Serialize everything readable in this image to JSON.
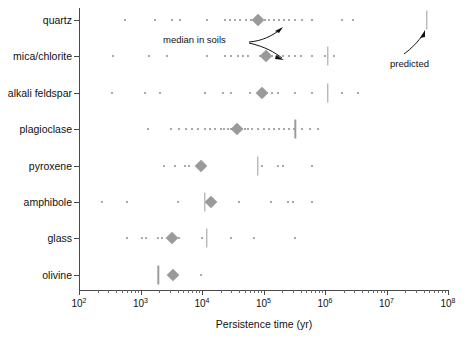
{
  "chart_data": {
    "type": "scatter",
    "title": "",
    "xlabel": "Persistence time (yr)",
    "ylabel": "",
    "xscale": "log",
    "xlim": [
      100,
      100000000
    ],
    "grid": false,
    "legend": "none",
    "xtick_labels": [
      "10",
      "10",
      "10",
      "10",
      "10",
      "10",
      "10"
    ],
    "xtick_exponents": [
      "2",
      "3",
      "4",
      "5",
      "6",
      "7",
      "8"
    ],
    "xtick_values": [
      100,
      1000,
      10000,
      100000,
      1000000,
      10000000,
      100000000
    ],
    "categories": [
      "quartz",
      "mica/chlorite",
      "alkali feldspar",
      "plagioclase",
      "pyroxene",
      "amphibole",
      "glass",
      "olivine"
    ],
    "marker_legend": {
      "dot": "individual soil observation",
      "diamond": "median in soils",
      "bar": "predicted"
    },
    "annotations": [
      {
        "text": "median in soils",
        "x": 100000,
        "y": "between quartz and mica/chlorite"
      },
      {
        "text": "predicted",
        "x": 30000000,
        "y": "below quartz predicted bar"
      }
    ],
    "series": [
      {
        "name": "quartz",
        "median_in_soils": 80000,
        "predicted": 45000000,
        "observations": [
          560,
          1700,
          3200,
          4400,
          12000,
          24000,
          28000,
          34000,
          42000,
          52000,
          62000,
          72000,
          88000,
          105000,
          125000,
          150000,
          180000,
          215000,
          260000,
          320000,
          420000,
          620000,
          1900000,
          2900000
        ]
      },
      {
        "name": "mica/chlorite",
        "median_in_soils": 110000,
        "predicted": 1100000,
        "observations": [
          360,
          1400,
          2700,
          12000,
          24000,
          30000,
          38000,
          46000,
          56000,
          88000,
          140000,
          170000,
          210000,
          260000,
          320000,
          400000,
          620000,
          1000000,
          1400000
        ]
      },
      {
        "name": "alkali feldspar",
        "median_in_soils": 93000,
        "predicted": 1100000,
        "observations": [
          340,
          1200,
          2100,
          11000,
          22000,
          30000,
          60000,
          93000,
          115000,
          140000,
          175000,
          330000,
          620000,
          1900000,
          3400000
        ]
      },
      {
        "name": "plagioclase",
        "median_in_soils": 37000,
        "predicted": 330000,
        "observations": [
          1300,
          3100,
          4200,
          5400,
          6800,
          8600,
          11000,
          13500,
          16000,
          20000,
          23000,
          26000,
          30000,
          34000,
          37000,
          44000,
          50000,
          57000,
          66000,
          80000,
          100000,
          125000,
          150000,
          180000,
          215000,
          260000,
          310000,
          420000,
          560000,
          760000
        ]
      },
      {
        "name": "pyroxene",
        "median_in_soils": 9500,
        "predicted": 80000,
        "observations": [
          2400,
          3600,
          5200,
          6100,
          9500,
          95000,
          175000,
          210000,
          620000
        ]
      },
      {
        "name": "amphibole",
        "median_in_soils": 14000,
        "predicted": 11000,
        "observations": [
          240,
          610,
          4100,
          12000,
          14000,
          40000,
          130000,
          250000,
          300000,
          620000
        ]
      },
      {
        "name": "glass",
        "median_in_soils": 3300,
        "predicted": 12000,
        "observations": [
          600,
          1050,
          1250,
          1900,
          2200,
          3300,
          4200,
          10000,
          30000,
          70000,
          330000
        ]
      },
      {
        "name": "olivine",
        "median_in_soils": 3400,
        "predicted": 1950,
        "observations": [
          9500
        ]
      }
    ]
  },
  "axis": {
    "x_title": "Persistence time (yr)"
  },
  "labels": {
    "median_in_soils": "median in soils",
    "predicted": "predicted"
  },
  "colors": {
    "dot": "#8d8d8d",
    "median": "#9a9a9a",
    "predicted": "#9c9c9c",
    "axis": "#4a4a4a",
    "text": "#111111",
    "background": "#ffffff"
  }
}
